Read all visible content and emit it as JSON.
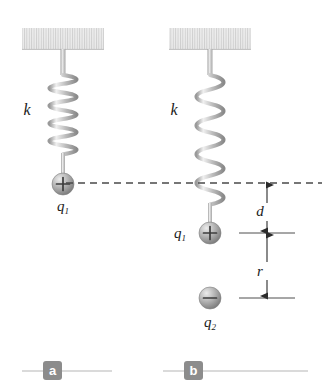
{
  "figure": {
    "width": 329,
    "height": 389,
    "background": "#ffffff"
  },
  "colors": {
    "ceiling_fill": "#e6e6e6",
    "ceiling_hatch": "#c9c9c9",
    "spring_light": "#f2f2f2",
    "spring_mid": "#c2c2c2",
    "spring_dark": "#8f8f8f",
    "sphere_light": "#d8d8d8",
    "sphere_mid": "#a8a8a8",
    "sphere_dark": "#6e6e6e",
    "dash_line": "#4a4a4a",
    "dimension_line": "#2b2b2b",
    "tick_line": "#3a3a3a",
    "badge_fill": "#8c8c8c",
    "badge_text": "#ffffff",
    "rule_line": "#b5b5b5",
    "text": "#1a1a1a"
  },
  "panels": [
    {
      "id": "a",
      "letter": "a",
      "badge_x": 43,
      "badge_y": 362,
      "rule_y": 371,
      "rule_x1": 22,
      "rule_x2": 112,
      "ceiling": {
        "x": 22,
        "y": 28,
        "width": 82,
        "height": 21
      },
      "stem_top": {
        "x": 63,
        "y1": 49,
        "y2": 74
      },
      "spring": {
        "cx": 63,
        "y_top": 74,
        "y_bottom": 156,
        "coils": 13,
        "radius_x": 18,
        "state": "relaxed"
      },
      "stem_bottom": {
        "x": 63,
        "y1": 156,
        "y2": 174
      },
      "charges": [
        {
          "name": "q1",
          "label": "q",
          "subscript": "1",
          "sign": "+",
          "cx": 63,
          "cy": 184,
          "r": 11,
          "label_x": 63,
          "label_y": 211,
          "label_anchor": "middle"
        }
      ],
      "spring_label": {
        "text": "k",
        "x": 27,
        "y": 115
      },
      "dimensions": []
    },
    {
      "id": "b",
      "letter": "b",
      "badge_x": 184,
      "badge_y": 362,
      "rule_y": 371,
      "rule_x1": 163,
      "rule_x2": 308,
      "ceiling": {
        "x": 169,
        "y": 28,
        "width": 82,
        "height": 21
      },
      "stem_top": {
        "x": 210,
        "y1": 49,
        "y2": 74
      },
      "spring": {
        "cx": 210,
        "y_top": 74,
        "y_bottom": 207,
        "coils": 13,
        "radius_x": 18,
        "state": "stretched"
      },
      "stem_bottom": {
        "x": 210,
        "y1": 207,
        "y2": 223
      },
      "charges": [
        {
          "name": "q1",
          "label": "q",
          "subscript": "1",
          "sign": "+",
          "cx": 210,
          "cy": 233,
          "r": 11,
          "label_x": 186,
          "label_y": 238,
          "label_anchor": "end"
        },
        {
          "name": "q2",
          "label": "q",
          "subscript": "2",
          "sign": "−",
          "cx": 210,
          "cy": 298,
          "r": 11,
          "label_x": 210,
          "label_y": 327,
          "label_anchor": "middle"
        }
      ],
      "spring_label": {
        "text": "k",
        "x": 174,
        "y": 115
      },
      "dimensions": [
        {
          "name": "d",
          "label": "d",
          "axis_x": 267,
          "y_top": 183,
          "y_bottom": 233,
          "label_x": 259,
          "label_y": 212,
          "tick": {
            "y": 233,
            "x1": 239,
            "x2": 295
          }
        },
        {
          "name": "r",
          "label": "r",
          "axis_x": 267,
          "y_top": 233,
          "y_bottom": 298,
          "label_x": 259,
          "label_y": 272,
          "tick": {
            "y": 298,
            "x1": 239,
            "x2": 295
          }
        }
      ]
    }
  ],
  "equilibrium_line": {
    "name": "equilibrium-dashed-line",
    "y": 183,
    "x1": 66,
    "x2": 322,
    "dash": "7 5"
  }
}
